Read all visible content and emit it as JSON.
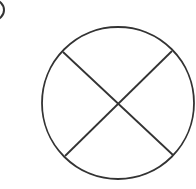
{
  "diagram": {
    "stroke_color": "#333333",
    "background": "#ffffff",
    "circle": {
      "cx": 118,
      "cy": 103,
      "r": 76
    },
    "lines": [
      {
        "x1": 63,
        "y1": 52,
        "x2": 173,
        "y2": 155
      },
      {
        "x1": 172,
        "y1": 51,
        "x2": 65,
        "y2": 156
      }
    ],
    "corner_fragment": {
      "cx": -8,
      "cy": 10,
      "r": 10
    }
  }
}
